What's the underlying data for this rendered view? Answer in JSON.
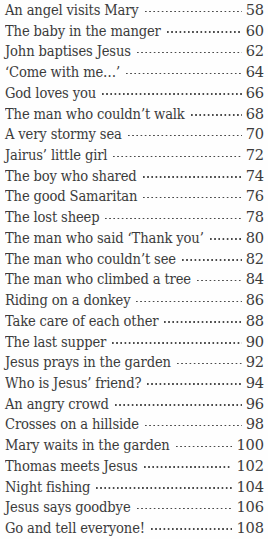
{
  "document": {
    "kind": "table-of-contents",
    "text_color": "#3b3b3b",
    "background_color": "#fefefe",
    "leader_style": "dotted"
  },
  "entries": [
    {
      "title": "An angel visits Mary",
      "page": "58"
    },
    {
      "title": "The baby in the manger",
      "page": "60"
    },
    {
      "title": "John baptises Jesus",
      "page": "62"
    },
    {
      "title": "‘Come with me…’",
      "page": "64"
    },
    {
      "title": "God loves you",
      "page": "66"
    },
    {
      "title": "The man who couldn’t walk",
      "page": "68"
    },
    {
      "title": "A very stormy sea",
      "page": "70"
    },
    {
      "title": "Jairus’ little girl",
      "page": "72"
    },
    {
      "title": "The boy who shared",
      "page": "74"
    },
    {
      "title": "The good Samaritan",
      "page": "76"
    },
    {
      "title": "The lost sheep",
      "page": "78"
    },
    {
      "title": "The man who said ‘Thank you’",
      "page": "80"
    },
    {
      "title": "The man who couldn’t see",
      "page": "82"
    },
    {
      "title": "The man who climbed a tree",
      "page": "84"
    },
    {
      "title": "Riding on a donkey",
      "page": "86"
    },
    {
      "title": "Take care of each other",
      "page": "88"
    },
    {
      "title": "The last supper",
      "page": "90"
    },
    {
      "title": "Jesus prays in the garden",
      "page": "92"
    },
    {
      "title": "Who is Jesus’ friend?",
      "page": "94"
    },
    {
      "title": "An angry crowd",
      "page": "96"
    },
    {
      "title": "Crosses on a hillside",
      "page": "98"
    },
    {
      "title": "Mary waits in the garden",
      "page": "100"
    },
    {
      "title": "Thomas meets Jesus",
      "page": "102"
    },
    {
      "title": "Night fishing",
      "page": "104"
    },
    {
      "title": "Jesus says goodbye",
      "page": "106"
    },
    {
      "title": "Go and tell everyone!",
      "page": "108"
    }
  ]
}
